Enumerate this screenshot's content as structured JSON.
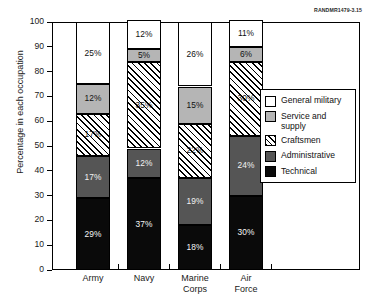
{
  "source_note": "RANDMR1479-3.15",
  "chart_data": {
    "type": "bar",
    "subtype": "stacked-percentage",
    "title": "",
    "subtitle": "",
    "xlabel": "",
    "ylabel": "Percentage in each occupation",
    "ylim": [
      0,
      100
    ],
    "ytick_step": 10,
    "yticks": [
      100,
      90,
      80,
      70,
      60,
      50,
      40,
      30,
      20,
      10,
      0
    ],
    "grid": false,
    "legend_position": "right-inside",
    "categories": [
      "Army",
      "Navy",
      "Marine Corps",
      "Air Force"
    ],
    "category_lines": [
      [
        "Army"
      ],
      [
        "Navy"
      ],
      [
        "Marine",
        "Corps"
      ],
      [
        "Air",
        "Force"
      ]
    ],
    "series": [
      {
        "name": "General military",
        "key": "general",
        "color": "#ffffff",
        "pattern": "solid",
        "values": [
          25,
          12,
          26,
          11
        ],
        "labels": [
          "25%",
          "12%",
          "26%",
          "11%"
        ]
      },
      {
        "name": "Service and supply",
        "key": "service",
        "color": "#b5b5b5",
        "pattern": "solid",
        "values": [
          12,
          5,
          15,
          6
        ],
        "labels": [
          "12%",
          "5%",
          "15%",
          "6%"
        ]
      },
      {
        "name": "Craftsmen",
        "key": "craftsmen",
        "color": "#ffffff",
        "pattern": "diagonal-hatch",
        "values": [
          17,
          35,
          22,
          30
        ],
        "labels": [
          "17%",
          "35%",
          "22%",
          "30%"
        ]
      },
      {
        "name": "Administrative",
        "key": "admin",
        "color": "#555555",
        "pattern": "solid",
        "values": [
          17,
          12,
          19,
          24
        ],
        "labels": [
          "17%",
          "12%",
          "19%",
          "24%"
        ]
      },
      {
        "name": "Technical",
        "key": "technical",
        "color": "#0a0a0a",
        "pattern": "solid",
        "values": [
          29,
          37,
          18,
          30
        ],
        "labels": [
          "29%",
          "37%",
          "18%",
          "30%"
        ]
      }
    ],
    "legend_entries": [
      {
        "label": "General military",
        "key": "general"
      },
      {
        "label": "Service and supply",
        "key": "service"
      },
      {
        "label": "Craftsmen",
        "key": "craftsmen"
      },
      {
        "label": "Administrative",
        "key": "admin"
      },
      {
        "label": "Technical",
        "key": "technical"
      }
    ]
  }
}
